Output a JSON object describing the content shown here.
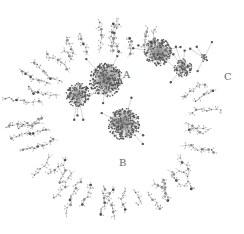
{
  "diagram": {
    "type": "network",
    "background": "#ffffff",
    "node_color": "#555555",
    "edge_color": "#9a9a9a",
    "labels": [
      {
        "text": "A",
        "x": 123,
        "y": 70
      },
      {
        "text": "B",
        "x": 119,
        "y": 158
      },
      {
        "text": "C",
        "x": 224,
        "y": 72
      }
    ],
    "hubs": [
      {
        "id": "A",
        "cx": 106,
        "cy": 80,
        "r": 17
      },
      {
        "id": "hub2",
        "cx": 158,
        "cy": 52,
        "r": 14
      },
      {
        "id": "hub3",
        "cx": 124,
        "cy": 124,
        "r": 16
      },
      {
        "id": "hub4",
        "cx": 183,
        "cy": 68,
        "r": 9
      },
      {
        "id": "hub5",
        "cx": 78,
        "cy": 95,
        "r": 12
      },
      {
        "id": "hub6",
        "cx": 204,
        "cy": 58,
        "r": 4
      }
    ]
  }
}
